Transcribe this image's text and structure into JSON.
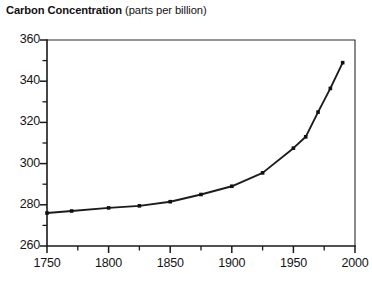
{
  "chart_data": {
    "type": "line",
    "title": "Carbon Concentration (parts per billion)",
    "title_bold_part": "Carbon Concentration",
    "title_regular_part": "(parts per billion)",
    "xlabel": "",
    "ylabel": "",
    "xlim": [
      1750,
      2000
    ],
    "ylim": [
      260,
      360
    ],
    "grid": false,
    "legend": "none",
    "x_major_ticks": [
      1750,
      1800,
      1850,
      1900,
      1950,
      2000
    ],
    "x_minor_ticks": [
      1775,
      1825,
      1875,
      1925,
      1975
    ],
    "x_tick_labels": [
      "1750",
      "1800",
      "1850",
      "1900",
      "1950",
      "2000"
    ],
    "y_major_ticks": [
      260,
      280,
      300,
      320,
      340,
      360
    ],
    "y_minor_ticks": [
      270,
      290,
      310,
      330,
      350
    ],
    "y_tick_labels": [
      "260",
      "280",
      "300",
      "320",
      "340",
      "360"
    ],
    "marker": "square",
    "line_color": "#1c1c1c",
    "x": [
      1750,
      1770,
      1800,
      1825,
      1850,
      1875,
      1900,
      1925,
      1950,
      1960,
      1970,
      1980,
      1990
    ],
    "values": [
      276,
      277,
      278.5,
      279.5,
      281.5,
      285,
      289,
      295.5,
      307.5,
      313,
      325,
      336.5,
      349
    ],
    "series": [
      {
        "name": "Carbon Concentration",
        "values": [
          276,
          277,
          278.5,
          279.5,
          281.5,
          285,
          289,
          295.5,
          307.5,
          313,
          325,
          336.5,
          349
        ]
      }
    ]
  }
}
